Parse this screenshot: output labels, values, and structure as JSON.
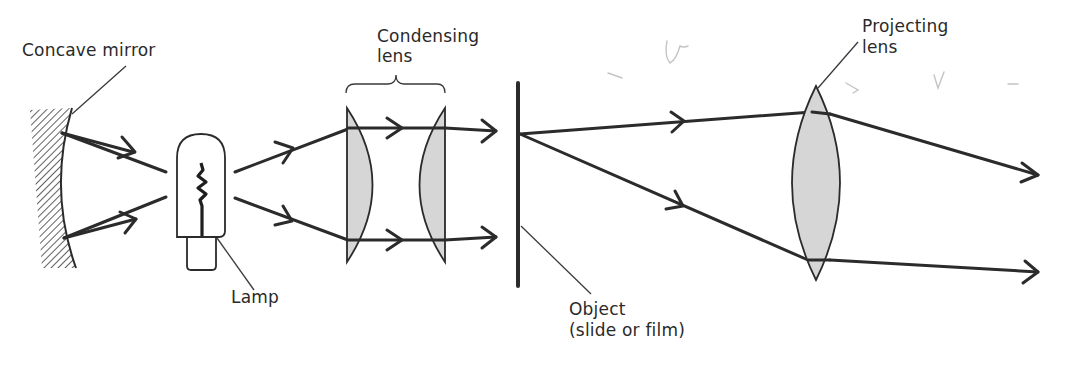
{
  "diagram": {
    "labels": {
      "concave_mirror": "Concave mirror",
      "lamp": "Lamp",
      "condensing_lens_line1": "Condensing",
      "condensing_lens_line2": "lens",
      "object_line1": "Object",
      "object_line2": "(slide or film)",
      "projecting_lens_line1": "Projecting",
      "projecting_lens_line2": "lens"
    },
    "components": [
      {
        "id": "concave-mirror",
        "type": "mirror",
        "label": "Concave mirror"
      },
      {
        "id": "lamp",
        "type": "light-source",
        "label": "Lamp"
      },
      {
        "id": "condensing-lens-1",
        "type": "plano-convex-lens",
        "label": "Condensing lens"
      },
      {
        "id": "condensing-lens-2",
        "type": "plano-convex-lens",
        "label": "Condensing lens"
      },
      {
        "id": "object",
        "type": "slide",
        "label": "Object (slide or film)"
      },
      {
        "id": "projecting-lens",
        "type": "biconvex-lens",
        "label": "Projecting lens"
      }
    ],
    "colors": {
      "ink": "#2b2b2b",
      "lens_fill": "#d6d6d6",
      "background": "#ffffff",
      "pencil_marks": "#c4c4c4"
    }
  }
}
